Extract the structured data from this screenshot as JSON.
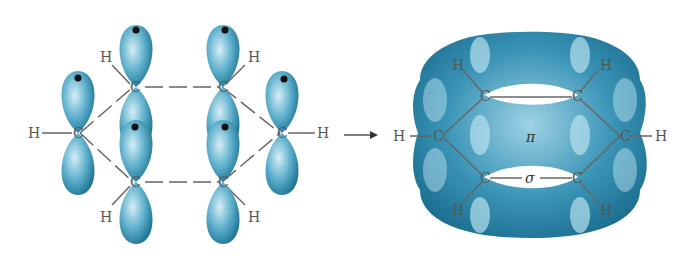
{
  "diagram": {
    "left_panel": {
      "atoms": {
        "carbon": "C",
        "hydrogen": "H"
      },
      "carbon_count": 6,
      "hydrogen_count": 6,
      "orbitals": "p orbitals each with one electron (dot)"
    },
    "arrow": {
      "direction": "right"
    },
    "right_panel": {
      "atoms": {
        "carbon": "C",
        "hydrogen": "H"
      },
      "pi_label": "π",
      "sigma_label": "σ"
    },
    "colors": {
      "orbital": "#2f86a8",
      "orbital_light": "#bfe3ef",
      "bond": "#666666",
      "text": "#555555"
    }
  }
}
